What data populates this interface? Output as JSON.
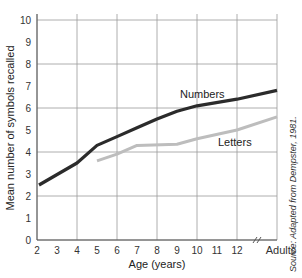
{
  "chart_data": {
    "type": "line",
    "title": "",
    "xlabel": "Age (years)",
    "ylabel": "Mean number of symbols recalled",
    "ylim": [
      0,
      10
    ],
    "yticks": [
      "0",
      "1",
      "2",
      "3",
      "4",
      "5",
      "6",
      "7",
      "8",
      "9",
      "10"
    ],
    "xticks": [
      "2",
      "3",
      "4",
      "5",
      "6",
      "7",
      "8",
      "9",
      "10",
      "11",
      "12",
      "Adults"
    ],
    "grid": true,
    "axis_break": "between 12 and Adults",
    "series": [
      {
        "name": "Numbers",
        "color": "#2b2b2b",
        "points": [
          {
            "x": "2",
            "y": 2.5
          },
          {
            "x": "4",
            "y": 3.5
          },
          {
            "x": "5",
            "y": 4.3
          },
          {
            "x": "6",
            "y": 4.7
          },
          {
            "x": "7",
            "y": 5.1
          },
          {
            "x": "8",
            "y": 5.5
          },
          {
            "x": "9",
            "y": 5.85
          },
          {
            "x": "10",
            "y": 6.1
          },
          {
            "x": "12",
            "y": 6.4
          },
          {
            "x": "Adults",
            "y": 6.8
          }
        ]
      },
      {
        "name": "Letters",
        "color": "#bdbdbd",
        "points": [
          {
            "x": "5",
            "y": 3.6
          },
          {
            "x": "6",
            "y": 3.9
          },
          {
            "x": "7",
            "y": 4.3
          },
          {
            "x": "9",
            "y": 4.35
          },
          {
            "x": "10",
            "y": 4.6
          },
          {
            "x": "12",
            "y": 5.0
          },
          {
            "x": "Adults",
            "y": 5.6
          }
        ]
      }
    ],
    "annotations": {
      "source": "Source: Adapted from Dempster, 1981."
    }
  }
}
